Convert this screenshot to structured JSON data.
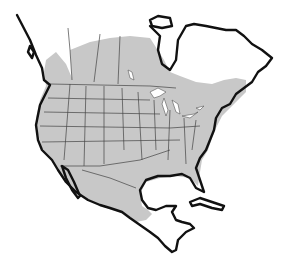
{
  "map": {
    "subject": "North America range map",
    "regions": [
      "Canada",
      "United States",
      "Mexico",
      "Central America",
      "Cuba",
      "Greenland (partial)"
    ],
    "legend": [],
    "colors": {
      "range_fill": "#c8c8c8",
      "land_fill": "#ffffff",
      "coastline": "#111111",
      "borders": "#444444",
      "background": "#ffffff"
    }
  }
}
